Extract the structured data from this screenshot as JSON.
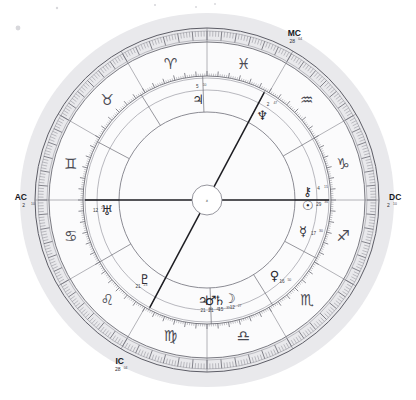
{
  "chart": {
    "center_mark": "x",
    "background": "#ffffff",
    "halo_color": "#e9e9ec",
    "ring_color": "#6f6f78",
    "axis_color": "#1d1d22",
    "geometry": {
      "cx": 207,
      "cy": 200,
      "r_halo": 187,
      "r_outer": 172,
      "r_tick_outer": 169,
      "r_tick_inner": 160,
      "r_sign_outer": 158,
      "r_sign_inner": 124,
      "r_house_outer": 122,
      "r_house_inner": 110,
      "r_inner": 88,
      "r_hub": 15
    }
  },
  "axes": [
    {
      "id": "mc",
      "label": "MC",
      "degree": "28",
      "minute": "04",
      "angle_deg": 62
    },
    {
      "id": "ac",
      "label": "AC",
      "degree": "2",
      "minute": "10",
      "angle_deg": 180
    },
    {
      "id": "dc",
      "label": "DC",
      "degree": "2",
      "minute": "10",
      "angle_deg": 0
    },
    {
      "id": "ic",
      "label": "IC",
      "degree": "28",
      "minute": "04",
      "angle_deg": 242
    }
  ],
  "signs": [
    {
      "name": "aries",
      "glyph": "♈",
      "angle_deg": 105
    },
    {
      "name": "pisces",
      "glyph": "♓",
      "angle_deg": 75
    },
    {
      "name": "aquarius",
      "glyph": "♒",
      "angle_deg": 45
    },
    {
      "name": "capricorn",
      "glyph": "♑",
      "angle_deg": 15
    },
    {
      "name": "sagittarius",
      "glyph": "♐",
      "angle_deg": 345
    },
    {
      "name": "scorpio",
      "glyph": "♏",
      "angle_deg": 315
    },
    {
      "name": "libra",
      "glyph": "♎",
      "angle_deg": 285
    },
    {
      "name": "virgo",
      "glyph": "♍",
      "angle_deg": 255
    },
    {
      "name": "leo",
      "glyph": "♌",
      "angle_deg": 225
    },
    {
      "name": "cancer",
      "glyph": "♋",
      "angle_deg": 195
    },
    {
      "name": "gemini",
      "glyph": "♊",
      "angle_deg": 165
    },
    {
      "name": "taurus",
      "glyph": "♉",
      "angle_deg": 135
    }
  ],
  "planets": [
    {
      "name": "jupiter",
      "glyph": "♃",
      "degree": "5",
      "minute": "10",
      "angle_deg": 95,
      "radius": 101
    },
    {
      "name": "neptune",
      "glyph": "♆",
      "degree": "2",
      "minute": "47",
      "angle_deg": 57,
      "radius": 101
    },
    {
      "name": "chiron",
      "glyph": "⚷",
      "degree": "4",
      "minute": "15",
      "angle_deg": 5,
      "radius": 101
    },
    {
      "name": "sun",
      "glyph": "☉",
      "degree": "29",
      "minute": "36",
      "angle_deg": 357,
      "radius": 101
    },
    {
      "name": "mercury",
      "glyph": "☿",
      "degree": "17",
      "minute": "30",
      "angle_deg": 342,
      "radius": 101
    },
    {
      "name": "venus",
      "glyph": "♀",
      "degree": "16",
      "minute": "50",
      "angle_deg": 312,
      "radius": 101
    },
    {
      "name": "jupiter_lower",
      "glyph": "♃",
      "degree": "21",
      "minute": "20",
      "angle_deg": 268,
      "radius": 101
    },
    {
      "name": "mars",
      "glyph": "♂",
      "degree": "21",
      "minute": "40",
      "angle_deg": 272,
      "radius": 101
    },
    {
      "name": "saturn",
      "glyph": "♄",
      "degree": "15",
      "minute": "31",
      "angle_deg": 277,
      "radius": 101
    },
    {
      "name": "moon",
      "glyph": "☽",
      "degree": "12",
      "minute": "27",
      "angle_deg": 283,
      "radius": 101
    },
    {
      "name": "pluto",
      "glyph": "♇",
      "degree": "21",
      "minute": "23",
      "angle_deg": 232,
      "radius": 101
    },
    {
      "name": "uranus",
      "glyph": "♅",
      "degree": "12",
      "minute": "27",
      "angle_deg": 186,
      "radius": 101
    }
  ],
  "house_cusps_deg": [
    0,
    30,
    62,
    92,
    122,
    152,
    180,
    210,
    242,
    272,
    302,
    332
  ],
  "specks": [
    {
      "x": 18,
      "y": 28,
      "r": 2.4
    },
    {
      "x": 57,
      "y": 8,
      "r": 1.2
    },
    {
      "x": 155,
      "y": 5,
      "r": 1.1
    },
    {
      "x": 196,
      "y": 7,
      "r": 1.0
    },
    {
      "x": 215,
      "y": 4,
      "r": 1.0
    }
  ]
}
